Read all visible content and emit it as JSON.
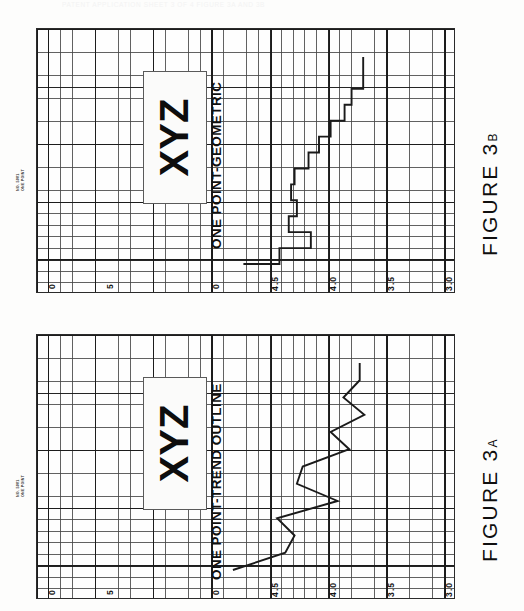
{
  "document": {
    "header_faint": "PATENT APPLICATION   SHEET 3 OF 4   FIGURE 3A AND 3B",
    "stamp_line1": "NO. 5001",
    "stamp_line2": "ONE POINT"
  },
  "panels": [
    {
      "id": "3b",
      "caption": "FIGURE",
      "caption_number": "3",
      "caption_suffix": "B",
      "chart_title": "ONE  POINT-GEOMETRIC",
      "callout": "XYZ",
      "scale_left_ticks": [
        "0",
        "5",
        "0"
      ],
      "scale_right_ticks": [
        "4.5",
        "4.0",
        "3.5",
        "3.0"
      ]
    },
    {
      "id": "3a",
      "caption": "FIGURE",
      "caption_number": "3",
      "caption_suffix": "A",
      "chart_title": "ONE  POINT-TREND  OUTLINE",
      "callout": "XYZ",
      "scale_left_ticks": [
        "0",
        "5",
        "0"
      ],
      "scale_right_ticks": [
        "4.5",
        "4.0",
        "3.5",
        "3.0"
      ]
    }
  ],
  "chart_data": [
    {
      "type": "line",
      "id": "figure-3a",
      "title": "ONE POINT-TREND OUTLINE",
      "subtitle": "FIGURE 3A",
      "orientation": "rotated-90-ccw",
      "xlabel": "",
      "ylabel": "",
      "ylim": [
        3.0,
        4.7
      ],
      "yticks": [
        3.0,
        3.5,
        4.0,
        4.5
      ],
      "secondary_ticks": [
        0,
        5,
        0
      ],
      "grid": true,
      "legend": "none",
      "series": [
        {
          "name": "trend outline",
          "x": [
            0,
            1,
            2,
            3,
            4,
            5,
            6,
            7,
            8,
            9,
            10,
            11,
            12
          ],
          "values": [
            3.43,
            3.43,
            3.57,
            3.39,
            3.68,
            3.52,
            3.92,
            3.97,
            3.62,
            4.14,
            3.99,
            4.07,
            4.52
          ]
        }
      ]
    },
    {
      "type": "line",
      "id": "figure-3b",
      "title": "ONE POINT-GEOMETRIC",
      "subtitle": "FIGURE 3B",
      "orientation": "rotated-90-ccw",
      "xlabel": "",
      "ylabel": "",
      "ylim": [
        3.0,
        4.7
      ],
      "yticks": [
        3.0,
        3.5,
        4.0,
        4.5
      ],
      "secondary_ticks": [
        0,
        5,
        0
      ],
      "grid": true,
      "legend": "none",
      "step": "post",
      "series": [
        {
          "name": "geometric moving average",
          "x": [
            0,
            1,
            2,
            3,
            4,
            5,
            6,
            7,
            8,
            9,
            10,
            11,
            12,
            13
          ],
          "values": [
            3.4,
            3.4,
            3.5,
            3.56,
            3.68,
            3.78,
            3.87,
            3.99,
            4.02,
            3.97,
            4.04,
            3.85,
            4.12,
            4.43
          ]
        }
      ]
    }
  ]
}
